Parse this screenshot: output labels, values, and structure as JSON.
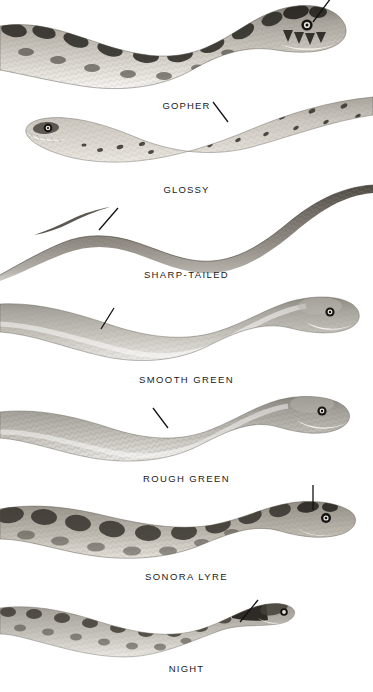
{
  "plate": {
    "type": "field-guide-illustration-plate",
    "subject": "snakes",
    "background_color": "#ffffff",
    "rendering": "grayscale halftone engraving",
    "width": 373,
    "height": 692
  },
  "species": [
    {
      "label": "GOPHER",
      "label_x": 160,
      "label_y": 100,
      "panel_top": 0,
      "panel_height": 95,
      "pattern": "bold dark saddle blotches on pale tan ground",
      "head_side": "right",
      "pointer": {
        "x1": 313,
        "y1": 22,
        "x2": 330,
        "y2": 2
      }
    },
    {
      "label": "GLOSSY",
      "label_x": 160,
      "label_y": 184,
      "panel_top": 95,
      "panel_height": 86,
      "pattern": "small scattered dark flecks on light ground",
      "head_side": "left",
      "pointer": {
        "x1": 228,
        "y1": 122,
        "x2": 213,
        "y2": 102
      }
    },
    {
      "label": "SHARP-TAILED",
      "label_x": 167,
      "label_y": 269,
      "panel_top": 181,
      "panel_height": 84,
      "pattern": "uniform dark grey, fine scale texture, S-curved body",
      "head_side": "left-tail-tip",
      "pointer": {
        "x1": 99,
        "y1": 230,
        "x2": 118,
        "y2": 208
      }
    },
    {
      "label": "SMOOTH GREEN",
      "label_x": 169,
      "label_y": 374,
      "panel_top": 290,
      "panel_height": 78,
      "pattern": "plain unmarked smooth scales, pale grey-green",
      "head_side": "right",
      "pointer": {
        "x1": 101,
        "y1": 329,
        "x2": 114,
        "y2": 308
      }
    },
    {
      "label": "ROUGH GREEN",
      "label_x": 168,
      "label_y": 473,
      "panel_top": 390,
      "panel_height": 78,
      "pattern": "plain unmarked keeled scales, pale grey-green",
      "head_side": "right",
      "pointer": {
        "x1": 168,
        "y1": 428,
        "x2": 154,
        "y2": 410
      }
    },
    {
      "label": "SONORA LYRE",
      "label_x": 170,
      "label_y": 571,
      "panel_top": 485,
      "panel_height": 80,
      "pattern": "irregular dark brown blotches, lyre mark on head",
      "head_side": "right",
      "pointer": {
        "x1": 313,
        "y1": 510,
        "x2": 313,
        "y2": 480
      }
    },
    {
      "label": "NIGHT",
      "label_x": 172,
      "label_y": 663,
      "panel_top": 590,
      "panel_height": 72,
      "pattern": "rows of small dark spots on pale grey ground, dark neck collar",
      "head_side": "right",
      "pointer": {
        "x1": 240,
        "y1": 622,
        "x2": 258,
        "y2": 600
      }
    }
  ]
}
